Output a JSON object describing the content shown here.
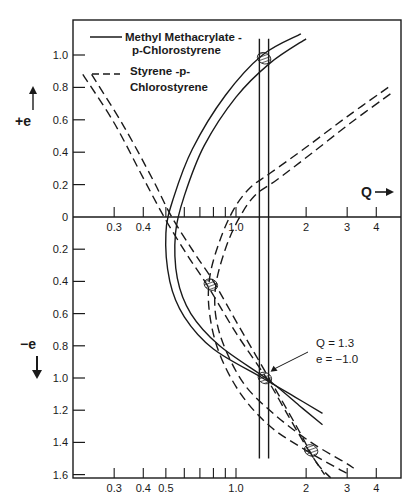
{
  "chart_data": {
    "type": "line",
    "title": "",
    "xlabel": "Q",
    "ylabel_positive": "+ e",
    "ylabel_negative": "− e",
    "x_scale": "log",
    "xlim": [
      0.22,
      5.0
    ],
    "ylim": [
      -1.62,
      1.15
    ],
    "x_ticks_top_axis": {
      "labeled": [
        {
          "value": 0.3,
          "label": "0.3"
        },
        {
          "value": 0.4,
          "label": "0.4"
        },
        {
          "value": 1.0,
          "label": "1.0"
        },
        {
          "value": 2,
          "label": "2"
        },
        {
          "value": 3,
          "label": "3"
        },
        {
          "value": 4,
          "label": "4"
        }
      ],
      "minor": [
        0.5,
        0.6,
        0.7,
        0.8,
        0.9
      ]
    },
    "x_ticks_bottom_axis": {
      "labeled": [
        {
          "value": 0.3,
          "label": "0.3"
        },
        {
          "value": 0.4,
          "label": "0.4"
        },
        {
          "value": 0.5,
          "label": "0.5"
        },
        {
          "value": 1.0,
          "label": "1.0"
        },
        {
          "value": 2,
          "label": "2"
        },
        {
          "value": 3,
          "label": "3"
        },
        {
          "value": 4,
          "label": "4"
        }
      ],
      "minor": [
        0.6,
        0.7,
        0.8,
        0.9
      ]
    },
    "y_ticks": [
      {
        "value": 1.0,
        "label": "1.0"
      },
      {
        "value": 0.8,
        "label": "0.8"
      },
      {
        "value": 0.6,
        "label": "0.6"
      },
      {
        "value": 0.4,
        "label": "0.4"
      },
      {
        "value": 0.2,
        "label": "0.2"
      },
      {
        "value": 0,
        "label": "0"
      },
      {
        "value": -0.2,
        "label": "0.2"
      },
      {
        "value": -0.4,
        "label": "0.4"
      },
      {
        "value": -0.6,
        "label": "0.6"
      },
      {
        "value": -0.8,
        "label": "0.8"
      },
      {
        "value": -1.0,
        "label": "1.0"
      },
      {
        "value": -1.2,
        "label": "1.2"
      },
      {
        "value": -1.4,
        "label": "1.4"
      },
      {
        "value": -1.6,
        "label": "1.6"
      }
    ],
    "legend": {
      "placement": "top-left",
      "entries": [
        {
          "label_lines": [
            "Methyl Methacrylate -",
            "p-Chlorostyrene"
          ],
          "style": "solid"
        },
        {
          "label_lines": [
            "Styrene -p-",
            "Chlorostyrene"
          ],
          "style": "dashed"
        }
      ]
    },
    "series": [
      {
        "name": "Methyl Methacrylate - p-Chlorostyrene (band edge 1)",
        "style": "solid",
        "points": [
          [
            1.9,
            1.13
          ],
          [
            1.3,
            1.0
          ],
          [
            0.9,
            0.75
          ],
          [
            0.65,
            0.42
          ],
          [
            0.54,
            0.12
          ],
          [
            0.5,
            -0.1
          ],
          [
            0.52,
            -0.4
          ],
          [
            0.6,
            -0.62
          ],
          [
            0.8,
            -0.82
          ],
          [
            1.3,
            -1.0
          ],
          [
            1.8,
            -1.12
          ],
          [
            2.35,
            -1.22
          ]
        ]
      },
      {
        "name": "Methyl Methacrylate - p-Chlorostyrene (band edge 2)",
        "style": "solid",
        "points": [
          [
            2.0,
            1.1
          ],
          [
            1.4,
            0.95
          ],
          [
            1.0,
            0.74
          ],
          [
            0.73,
            0.44
          ],
          [
            0.6,
            0.13
          ],
          [
            0.55,
            -0.1
          ],
          [
            0.56,
            -0.38
          ],
          [
            0.64,
            -0.6
          ],
          [
            0.85,
            -0.8
          ],
          [
            1.4,
            -1.02
          ],
          [
            1.9,
            -1.18
          ],
          [
            2.35,
            -1.29
          ]
        ]
      },
      {
        "name": "Methyl Methacrylate - p-Chlorostyrene (Q lower bound)",
        "style": "solid",
        "points": [
          [
            1.26,
            1.1
          ],
          [
            1.26,
            -1.5
          ]
        ]
      },
      {
        "name": "Methyl Methacrylate - p-Chlorostyrene (Q upper bound)",
        "style": "solid",
        "points": [
          [
            1.38,
            1.1
          ],
          [
            1.38,
            -1.5
          ]
        ]
      },
      {
        "name": "Styrene - p-Chlorostyrene (descending edge 1)",
        "style": "dashed",
        "points": [
          [
            0.22,
            0.88
          ],
          [
            0.3,
            0.58
          ],
          [
            0.4,
            0.24
          ],
          [
            0.5,
            -0.02
          ],
          [
            0.62,
            -0.24
          ],
          [
            0.75,
            -0.42
          ],
          [
            1.0,
            -0.72
          ],
          [
            1.35,
            -1.0
          ],
          [
            1.7,
            -1.25
          ],
          [
            2.05,
            -1.45
          ],
          [
            2.4,
            -1.6
          ]
        ]
      },
      {
        "name": "Styrene - p-Chlorostyrene (descending edge 2)",
        "style": "dashed",
        "points": [
          [
            0.24,
            0.88
          ],
          [
            0.33,
            0.56
          ],
          [
            0.44,
            0.23
          ],
          [
            0.53,
            0.0
          ],
          [
            0.66,
            -0.22
          ],
          [
            0.8,
            -0.4
          ],
          [
            1.05,
            -0.7
          ],
          [
            1.45,
            -1.05
          ],
          [
            1.85,
            -1.32
          ],
          [
            2.2,
            -1.52
          ],
          [
            2.55,
            -1.62
          ]
        ]
      },
      {
        "name": "Styrene - p-Chlorostyrene (arc edge 1)",
        "style": "dashed",
        "points": [
          [
            4.5,
            0.8
          ],
          [
            3.0,
            0.62
          ],
          [
            2.0,
            0.43
          ],
          [
            1.4,
            0.27
          ],
          [
            1.15,
            0.18
          ],
          [
            0.98,
            0.05
          ],
          [
            0.85,
            -0.15
          ],
          [
            0.77,
            -0.38
          ],
          [
            0.77,
            -0.6
          ],
          [
            0.85,
            -0.85
          ],
          [
            1.05,
            -1.1
          ],
          [
            1.4,
            -1.3
          ],
          [
            2.0,
            -1.45
          ],
          [
            2.8,
            -1.57
          ],
          [
            3.1,
            -1.6
          ]
        ]
      },
      {
        "name": "Styrene - p-Chlorostyrene (arc edge 2)",
        "style": "dashed",
        "points": [
          [
            4.6,
            0.76
          ],
          [
            3.1,
            0.58
          ],
          [
            2.1,
            0.39
          ],
          [
            1.5,
            0.23
          ],
          [
            1.2,
            0.13
          ],
          [
            1.02,
            -0.02
          ],
          [
            0.9,
            -0.2
          ],
          [
            0.82,
            -0.42
          ],
          [
            0.82,
            -0.62
          ],
          [
            0.9,
            -0.82
          ],
          [
            1.1,
            -1.05
          ],
          [
            1.5,
            -1.24
          ],
          [
            2.1,
            -1.4
          ],
          [
            2.9,
            -1.52
          ],
          [
            3.2,
            -1.56
          ]
        ]
      }
    ],
    "highlighted_regions": [
      {
        "q": 1.32,
        "e": 0.98
      },
      {
        "q": 0.78,
        "e": -0.42
      },
      {
        "q": 1.33,
        "e": -1.0
      },
      {
        "q": 2.1,
        "e": -1.45
      }
    ],
    "annotations": [
      {
        "text_lines": [
          "Q = 1.3",
          "e = −1.0"
        ],
        "points_to": {
          "q": 1.38,
          "e": -0.98
        }
      }
    ]
  }
}
